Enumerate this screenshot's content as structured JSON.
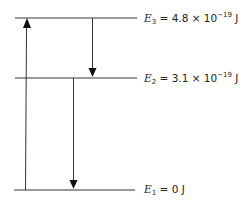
{
  "diagram": {
    "type": "energy-level-diagram",
    "colors": {
      "line": "#333333",
      "text": "#222222",
      "background": "#ffffff"
    },
    "levels": [
      {
        "symbol": "E",
        "subscript": "3",
        "equals": "=",
        "value": "4.8 × 10",
        "exponent": "−19",
        "unit": "J"
      },
      {
        "symbol": "E",
        "subscript": "2",
        "equals": "=",
        "value": "3.1 × 10",
        "exponent": "−19",
        "unit": "J"
      },
      {
        "symbol": "E",
        "subscript": "1",
        "equals": "=",
        "value": "0",
        "exponent": "",
        "unit": "J"
      }
    ],
    "transitions": [
      {
        "from": "E1",
        "to": "E3",
        "direction": "up"
      },
      {
        "from": "E3",
        "to": "E2",
        "direction": "down"
      },
      {
        "from": "E2",
        "to": "E1",
        "direction": "down"
      }
    ]
  }
}
